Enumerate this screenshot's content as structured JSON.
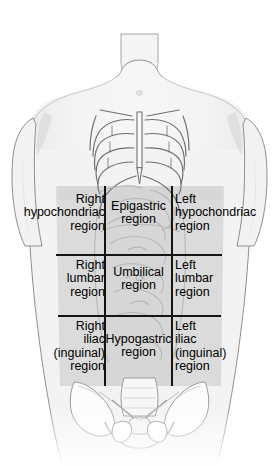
{
  "figure": {
    "width": 279,
    "height": 466
  },
  "colors": {
    "background": "#ffffff",
    "body_fill": "#f2f2f2",
    "body_outline": "#8a8a8a",
    "abdomen_shade": "#d8d8d8",
    "abdomen_shade_center": "#d2d2d2",
    "grid_line": "#1a1a1a",
    "bone_outline": "#6e6e6e",
    "bone_fill": "#fbfbfb",
    "viscera_line": "#b9b9b9",
    "label_text": "#000000"
  },
  "grid": {
    "left_x": 105,
    "right_x": 172,
    "top_y": 186,
    "upper_y": 255,
    "lower_y": 316,
    "bottom_y": 386,
    "line_width": 1.6,
    "columns": [
      "right",
      "center",
      "left"
    ],
    "rows": [
      "hypochondriac",
      "lumbar",
      "iliac"
    ]
  },
  "regions": [
    {
      "id": "right-hypochondriac",
      "label": "Right\nhypochondriac\nregion",
      "column": "right",
      "row": "upper",
      "align": "right"
    },
    {
      "id": "epigastric",
      "label": "Epigastric\nregion",
      "column": "center",
      "row": "upper",
      "align": "center"
    },
    {
      "id": "left-hypochondriac",
      "label": "Left\nhypochondriac\nregion",
      "column": "left",
      "row": "upper",
      "align": "left"
    },
    {
      "id": "right-lumbar",
      "label": "Right\nlumbar\nregion",
      "column": "right",
      "row": "middle",
      "align": "right"
    },
    {
      "id": "umbilical",
      "label": "Umbilical\nregion",
      "column": "center",
      "row": "middle",
      "align": "center"
    },
    {
      "id": "left-lumbar",
      "label": "Left\nlumbar\nregion",
      "column": "left",
      "row": "middle",
      "align": "left"
    },
    {
      "id": "right-iliac",
      "label": "Right\niliac\n(inguinal)\nregion",
      "column": "right",
      "row": "lower",
      "align": "right"
    },
    {
      "id": "hypogastric",
      "label": "Hypogastric\nregion",
      "column": "center",
      "row": "lower",
      "align": "center"
    },
    {
      "id": "left-iliac",
      "label": "Left\niliac\n(inguinal)\nregion",
      "column": "left",
      "row": "lower",
      "align": "left"
    }
  ],
  "anatomy": {
    "structures": [
      "neck",
      "shoulders",
      "upper-arms",
      "thorax",
      "rib-cage",
      "sternum",
      "xiphoid-process",
      "costal-margin",
      "abdominal-wall",
      "intestines",
      "pelvis",
      "ilium",
      "sacrum",
      "pubic-symphysis",
      "obturator-foramen"
    ]
  }
}
